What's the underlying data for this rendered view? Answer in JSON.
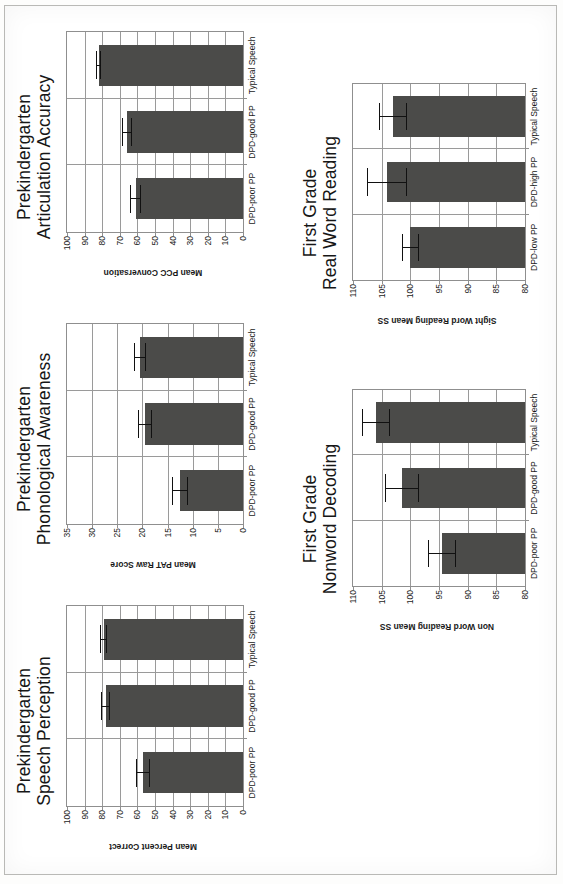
{
  "figure": {
    "bar_color": "#4b4b49",
    "axis_color": "#8f8f8f",
    "grid_color": "#9a9a9a",
    "error_color": "#111111"
  },
  "chart_data": [
    {
      "id": "speech-perception",
      "type": "bar",
      "title_lines": [
        "Prekindergarten",
        "Speech Perception"
      ],
      "title": "Prekindergarten Speech Perception",
      "xlabel": "",
      "ylabel": "Mean Percent Correct",
      "categories": [
        "DPD-poor PP",
        "DPD-good PP",
        "Typical Speech"
      ],
      "values": [
        57,
        78,
        79
      ],
      "errors": [
        4,
        2.5,
        2
      ],
      "ylim": [
        0,
        100
      ],
      "yticks": [
        0,
        10,
        20,
        30,
        40,
        50,
        60,
        70,
        80,
        90,
        100
      ],
      "grid": true,
      "legend": "none"
    },
    {
      "id": "phonological-awareness",
      "type": "bar",
      "title_lines": [
        "Prekindergarten",
        "Phonological Awareness"
      ],
      "title": "Prekindergarten Phonological Awareness",
      "xlabel": "",
      "ylabel": "Mean PAT Raw Score",
      "categories": [
        "DPD-poor PP",
        "DPD-good PP",
        "Typical Speech"
      ],
      "values": [
        12.5,
        19.5,
        20.5
      ],
      "errors": [
        1.6,
        1.4,
        1.2
      ],
      "ylim": [
        0,
        35
      ],
      "yticks": [
        0,
        5,
        10,
        15,
        20,
        25,
        30,
        35
      ],
      "grid": true,
      "legend": "none"
    },
    {
      "id": "articulation-accuracy",
      "type": "bar",
      "title_lines": [
        "Prekindergarten",
        "Articulation Accuracy"
      ],
      "title": "Prekindergarten Articulation Accuracy",
      "xlabel": "",
      "ylabel": "Mean PCC Conversation",
      "categories": [
        "DPD-poor PP",
        "DPD-good PP",
        "Typical Speech"
      ],
      "values": [
        61,
        66,
        82
      ],
      "errors": [
        3,
        3,
        1.5
      ],
      "ylim": [
        0,
        100
      ],
      "yticks": [
        0,
        10,
        20,
        30,
        40,
        50,
        60,
        70,
        80,
        90,
        100
      ],
      "grid": true,
      "legend": "none"
    },
    {
      "id": "nonword-decoding",
      "type": "bar",
      "title_lines": [
        "First Grade",
        "Nonword Decoding"
      ],
      "title": "First Grade Nonword Decoding",
      "xlabel": "",
      "ylabel": "Non Word Reading Mean SS",
      "categories": [
        "DPD-poor PP",
        "DPD-good PP",
        "Typical Speech"
      ],
      "values": [
        94.5,
        101.5,
        106
      ],
      "errors": [
        2.5,
        3,
        2.5
      ],
      "ylim": [
        80,
        110
      ],
      "yticks": [
        80,
        85,
        90,
        95,
        100,
        105,
        110
      ],
      "grid": true,
      "legend": "none"
    },
    {
      "id": "real-word-reading",
      "type": "bar",
      "title_lines": [
        "First Grade",
        "Real Word Reading"
      ],
      "title": "First Grade Real Word Reading",
      "xlabel": "",
      "ylabel": "Sight Word Reading Mean SS",
      "categories": [
        "DPD-low PP",
        "DPD-high PP",
        "Typical Speech"
      ],
      "values": [
        100,
        104,
        103
      ],
      "errors": [
        1.5,
        3.5,
        2.5
      ],
      "ylim": [
        80,
        110
      ],
      "yticks": [
        80,
        85,
        90,
        95,
        100,
        105,
        110
      ],
      "grid": true,
      "legend": "none"
    }
  ]
}
